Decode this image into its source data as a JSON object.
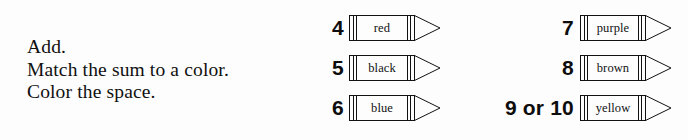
{
  "page": {
    "background_color": "#fdfdfd",
    "ink_color": "#111111"
  },
  "instructions": {
    "lines": [
      "Add.",
      "Match the sum to a color.",
      "Color the space."
    ]
  },
  "legend": {
    "columns": [
      {
        "name": "left-column",
        "entries": [
          {
            "sum": "4",
            "color": "red"
          },
          {
            "sum": "5",
            "color": "black"
          },
          {
            "sum": "6",
            "color": "blue"
          }
        ]
      },
      {
        "name": "right-column",
        "entries": [
          {
            "sum": "7",
            "color": "purple"
          },
          {
            "sum": "8",
            "color": "brown"
          },
          {
            "sum": "9 or 10",
            "color": "yellow"
          }
        ]
      }
    ]
  }
}
